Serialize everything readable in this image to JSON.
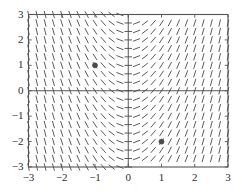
{
  "figure": {
    "type": "slope-field",
    "background_color": "#ffffff",
    "frame_color": "#555555",
    "segment_color": "#4a4a4a",
    "axis_color": "#444444",
    "point_color": "#4b4b4b",
    "label_color": "#2e2e2e"
  },
  "chart_data": {
    "type": "scatter",
    "title": "",
    "subtitle": "",
    "xlabel": "",
    "ylabel": "",
    "xlim": [
      -3,
      3
    ],
    "ylim": [
      -3,
      3
    ],
    "grid": false,
    "legend": null,
    "legend_position": "none",
    "x_ticks": [
      -3,
      -2,
      -1,
      0,
      1,
      2,
      3
    ],
    "y_ticks": [
      -3,
      -2,
      -1,
      0,
      1,
      2,
      3
    ],
    "x_tick_labels": [
      "−3",
      "−2",
      "−1",
      "0",
      "1",
      "2",
      "3"
    ],
    "y_tick_labels": [
      "−3",
      "−2",
      "−1",
      "0",
      "1",
      "2",
      "3"
    ],
    "tick_direction": "in",
    "axes_drawn": [
      "x=0 vertical axis line",
      "y=0 horizontal axis line"
    ],
    "slope_field": {
      "description": "Direction field of dy/dx depending on x only; slope is 0 near x=0 and increases in magnitude away from x=0, negative for x<0 and positive for x>0",
      "slope_formula": "dy/dx = 2*x",
      "slope_clamp": 6,
      "grid_columns": 25,
      "grid_rows": 19,
      "segment_length_px": 7.5,
      "x_samples": [
        -3,
        -2.75,
        -2.5,
        -2.25,
        -2,
        -1.75,
        -1.5,
        -1.25,
        -1,
        -0.75,
        -0.5,
        -0.25,
        0,
        0.25,
        0.5,
        0.75,
        1,
        1.25,
        1.5,
        1.75,
        2,
        2.25,
        2.5,
        2.75,
        3
      ],
      "y_samples": [
        -3,
        -2.666,
        -2.333,
        -2,
        -1.666,
        -1.333,
        -1,
        -0.666,
        -0.333,
        0,
        0.333,
        0.666,
        1,
        1.333,
        1.666,
        2,
        2.333,
        2.666,
        3
      ],
      "slopes_at_x_samples": [
        -6,
        -5.5,
        -5,
        -4.5,
        -4,
        -3.5,
        -3,
        -2.5,
        -2,
        -1.5,
        -1,
        -0.5,
        0,
        0.5,
        1,
        1.5,
        2,
        2.5,
        3,
        3.5,
        4,
        4.5,
        5,
        5.5,
        6
      ]
    },
    "points": [
      {
        "label": "point-a",
        "x": -1,
        "y": 1,
        "radius_px": 2.6
      },
      {
        "label": "point-b",
        "x": 1,
        "y": -2,
        "radius_px": 2.6
      }
    ]
  }
}
